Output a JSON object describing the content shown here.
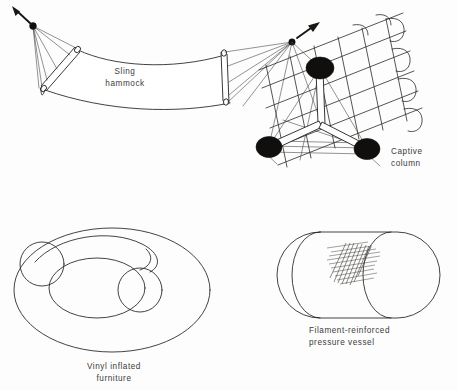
{
  "figure": {
    "background_color": "#fdfdfd",
    "ink_color": "#23211f",
    "text_color": "#3b3b3b",
    "width": 458,
    "height": 390
  },
  "panels": [
    {
      "id": "sling-hammock",
      "caption": "Sling\nhammock",
      "caption_align": "center",
      "description": "Sagging fabric membrane sling suspended between two spreader bars, each bar guyed by a fan of cables to an anchor point with a load arrow."
    },
    {
      "id": "captive-column",
      "caption": "Captive\ncolumn",
      "caption_align": "left",
      "description": "Tripod of three compression struts with black spherical end nodes, captured inside a curved tension mesh grid."
    },
    {
      "id": "vinyl-inflated-furniture",
      "caption": "Vinyl inflated\nfurniture",
      "caption_align": "center",
      "description": "Inflated toroidal ring drawn in perspective with two circular tube cross sections."
    },
    {
      "id": "filament-reinforced-pressure-vessel",
      "caption": "Filament-reinforced\npressure vessel",
      "caption_align": "left",
      "description": "Capsule shaped pressure vessel, cylinder with hemispherical domes, showing a patch of crosshatched helical filament winding."
    }
  ]
}
